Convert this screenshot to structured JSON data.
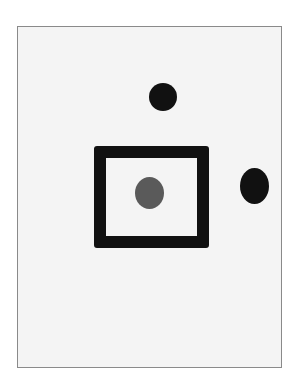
{
  "diagram": {
    "colors": {
      "paper": "#f4f4f4",
      "paper_border": "#8a8a8a",
      "ink": "#111111",
      "inner_dot": "#5a5a5a"
    },
    "shapes": [
      {
        "id": "square",
        "type": "square-outline",
        "color": "#111111"
      },
      {
        "id": "inner-dot",
        "type": "dot",
        "color": "#5a5a5a",
        "position": "inside square, center"
      },
      {
        "id": "top-dot",
        "type": "dot",
        "color": "#111111",
        "position": "above square"
      },
      {
        "id": "right-dot",
        "type": "dot",
        "color": "#111111",
        "position": "right of square"
      }
    ]
  }
}
